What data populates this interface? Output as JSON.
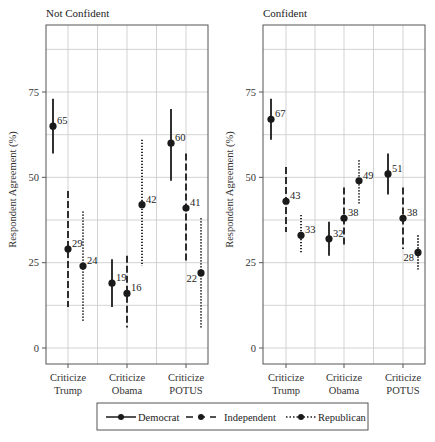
{
  "chart_data": [
    {
      "type": "errorbar-dotplot",
      "title": "Not Confident",
      "ylabel": "Respondent Agreement (%)",
      "xlabel": "",
      "ylim": [
        -5,
        95
      ],
      "yticks": [
        0,
        25,
        50,
        75
      ],
      "grid": true,
      "categories": [
        "Criticize Trump",
        "Criticize Obama",
        "Criticize POTUS"
      ],
      "series": [
        {
          "name": "Democrat",
          "line": "solid",
          "values": [
            65,
            19,
            60
          ],
          "ci_low": [
            57,
            12,
            49
          ],
          "ci_high": [
            73,
            26,
            70
          ]
        },
        {
          "name": "Independent",
          "line": "dashed",
          "values": [
            29,
            16,
            41
          ],
          "ci_low": [
            12,
            6,
            25
          ],
          "ci_high": [
            46,
            27,
            57
          ]
        },
        {
          "name": "Republican",
          "line": "dotted",
          "values": [
            24,
            42,
            22
          ],
          "ci_low": [
            8,
            24,
            6
          ],
          "ci_high": [
            40,
            61,
            38
          ]
        }
      ]
    },
    {
      "type": "errorbar-dotplot",
      "title": "Confident",
      "ylabel": "Respondent Agreement (%)",
      "xlabel": "",
      "ylim": [
        -5,
        95
      ],
      "yticks": [
        0,
        25,
        50,
        75
      ],
      "grid": true,
      "categories": [
        "Criticize Trump",
        "Criticize Obama",
        "Criticize POTUS"
      ],
      "series": [
        {
          "name": "Democrat",
          "line": "solid",
          "values": [
            67,
            32,
            51
          ],
          "ci_low": [
            61,
            27,
            45
          ],
          "ci_high": [
            73,
            37,
            57
          ]
        },
        {
          "name": "Independent",
          "line": "dashed",
          "values": [
            43,
            38,
            38
          ],
          "ci_low": [
            34,
            30,
            29
          ],
          "ci_high": [
            53,
            47,
            47
          ]
        },
        {
          "name": "Republican",
          "line": "dotted",
          "values": [
            33,
            49,
            28
          ],
          "ci_low": [
            28,
            42,
            23
          ],
          "ci_high": [
            39,
            55,
            33
          ]
        }
      ]
    }
  ],
  "panels": [
    {
      "title": "Not Confident",
      "ylabel": "Respondent Agreement (%)",
      "cat_lines": [
        [
          "Criticize",
          "Trump"
        ],
        [
          "Criticize",
          "Obama"
        ],
        [
          "Criticize",
          "POTUS"
        ]
      ]
    },
    {
      "title": "Confident",
      "ylabel": "Respondent Agreement (%)",
      "cat_lines": [
        [
          "Criticize",
          "Trump"
        ],
        [
          "Criticize",
          "Obama"
        ],
        [
          "Criticize",
          "POTUS"
        ]
      ]
    }
  ],
  "legend": {
    "position": "bottom",
    "items": [
      {
        "label": "Democrat",
        "line": "solid"
      },
      {
        "label": "Independent",
        "line": "dashed"
      },
      {
        "label": "Republican",
        "line": "dotted"
      }
    ]
  },
  "colors": {
    "ink": "#1a1a1a",
    "grid": "#c8c8c8",
    "frame": "#555555"
  }
}
